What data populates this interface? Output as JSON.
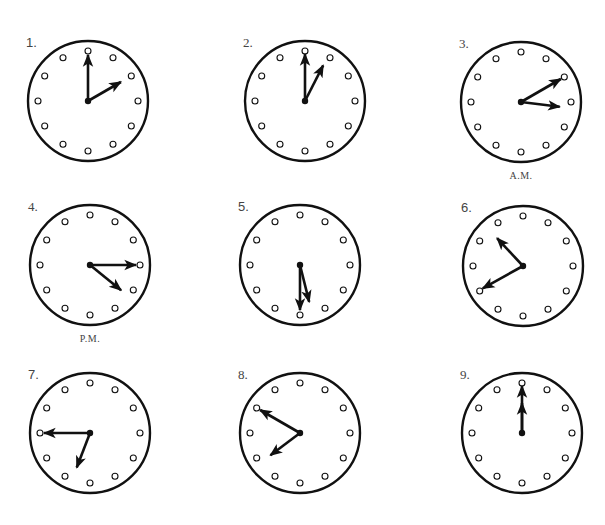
{
  "worksheet": {
    "colors": {
      "ink": "#111111",
      "label": "#444444",
      "background": "#ffffff"
    },
    "radius": 60,
    "clocks": [
      {
        "label": "1.",
        "cx": 88,
        "cy": 101,
        "hour_angle": 60,
        "hour_len": 38,
        "minute_angle": 0,
        "minute_len": 46,
        "period": "",
        "serif": false
      },
      {
        "label": "2.",
        "cx": 305,
        "cy": 101,
        "hour_angle": 27,
        "hour_len": 40,
        "minute_angle": 0,
        "minute_len": 47,
        "period": "",
        "serif": true
      },
      {
        "label": "3.",
        "cx": 521,
        "cy": 102,
        "hour_angle": 97,
        "hour_len": 39,
        "minute_angle": 60,
        "minute_len": 46,
        "period": "A.M.",
        "serif": true
      },
      {
        "label": "4.",
        "cx": 90,
        "cy": 265,
        "hour_angle": 129,
        "hour_len": 40,
        "minute_angle": 90,
        "minute_len": 46,
        "period": "P.M.",
        "serif": true
      },
      {
        "label": "5.",
        "cx": 300,
        "cy": 265,
        "hour_angle": 166,
        "hour_len": 38,
        "minute_angle": 180,
        "minute_len": 45,
        "period": "",
        "serif": false
      },
      {
        "label": "6.",
        "cx": 523,
        "cy": 266,
        "hour_angle": 317,
        "hour_len": 38,
        "minute_angle": 241,
        "minute_len": 46,
        "period": "",
        "serif": false
      },
      {
        "label": "7.",
        "cx": 90,
        "cy": 433,
        "hour_angle": 201,
        "hour_len": 37,
        "minute_angle": 270,
        "minute_len": 46,
        "period": "",
        "serif": false
      },
      {
        "label": "8.",
        "cx": 300,
        "cy": 433,
        "hour_angle": 233,
        "hour_len": 37,
        "minute_angle": 300,
        "minute_len": 46,
        "period": "",
        "serif": true
      },
      {
        "label": "9.",
        "cx": 522,
        "cy": 433,
        "hour_angle": 0,
        "hour_len": 30,
        "minute_angle": 0,
        "minute_len": 47,
        "period": "",
        "serif": true
      }
    ]
  }
}
